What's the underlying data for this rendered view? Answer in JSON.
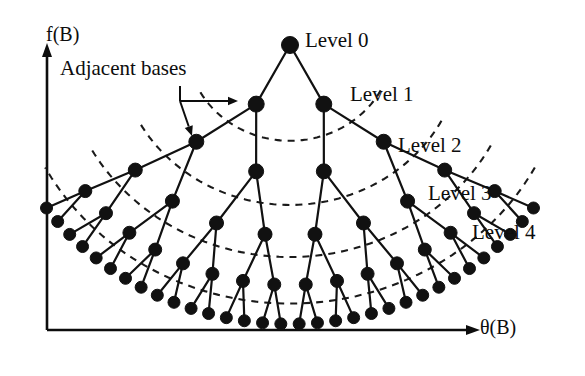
{
  "figure": {
    "kind": "radial-binary-tree-diagram",
    "background_color": "#ffffff",
    "ink_color": "#0d0d0d",
    "width": 585,
    "height": 376
  },
  "axes": {
    "y_axis_label": "f(B)",
    "x_axis_label": "θ(B)",
    "origin": {
      "x": 47,
      "y": 330
    },
    "y_axis_top": {
      "x": 47,
      "y": 52
    },
    "x_axis_right": {
      "x": 470,
      "y": 330
    },
    "line_color": "#0d0d0d",
    "line_width": 2.6
  },
  "annotation": {
    "text": "Adjacent bases",
    "text_position": {
      "x": 60,
      "y": 58
    },
    "stem": {
      "x1": 180,
      "y1": 86,
      "x2": 180,
      "y2": 101
    },
    "arrow_right_to": {
      "x": 238,
      "y": 101
    },
    "arrow_down_to": {
      "x": 192,
      "y": 136
    }
  },
  "level_labels": [
    {
      "label": "Level 0",
      "x": 305,
      "y": 30
    },
    {
      "label": "Level 1",
      "x": 350,
      "y": 84
    },
    {
      "label": "Level 2",
      "x": 398,
      "y": 135
    },
    {
      "label": "Level 3",
      "x": 428,
      "y": 183
    },
    {
      "label": "Level 4",
      "x": 472,
      "y": 222
    }
  ],
  "chart_data": {
    "type": "diagram",
    "title": "",
    "xlabel": "θ(B)",
    "ylabel": "f(B)",
    "apex": {
      "x": 290,
      "y": 45
    },
    "branching_factor": 2,
    "levels": 5,
    "node_counts": [
      1,
      2,
      4,
      8,
      16,
      32
    ],
    "node_radius": [
      8.5,
      8.0,
      7.5,
      7.0,
      6.5,
      6.0
    ],
    "level_radii": [
      0,
      72,
      140,
      205,
      258,
      300
    ],
    "angle_span_degrees": 112,
    "angle_center_degrees": 90,
    "arc_radii": [
      103,
      172,
      228,
      278
    ],
    "node_color": "#111111",
    "edge_color": "#111111",
    "arc_color": "#1a1a1a",
    "edge_width": 2.2,
    "arc_dash": "7,6"
  }
}
